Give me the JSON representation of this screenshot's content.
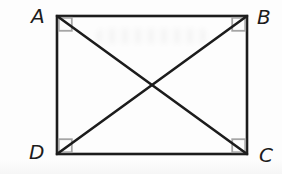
{
  "figure": {
    "type": "geometry-diagram",
    "shape": "rectangle",
    "vertices": [
      {
        "label": "A",
        "position": "top-left"
      },
      {
        "label": "B",
        "position": "top-right"
      },
      {
        "label": "C",
        "position": "bottom-right"
      },
      {
        "label": "D",
        "position": "bottom-left"
      }
    ],
    "diagonals": [
      "AC",
      "BD"
    ],
    "right_angle_markers": [
      "A",
      "B",
      "C",
      "D"
    ],
    "colors": {
      "line": "#1c1c1c",
      "angle_marker": "#a6a6a6",
      "label": "#1c1c1c",
      "background": "#fdfdfd"
    }
  }
}
